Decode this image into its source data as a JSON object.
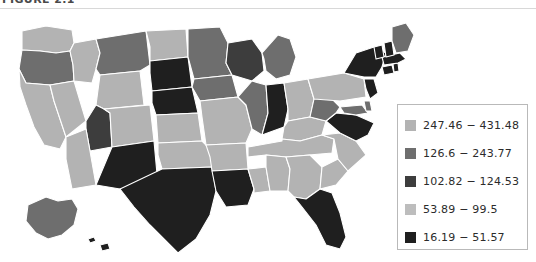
{
  "caption": {
    "text": "FIGURE 2.1"
  },
  "chart_data": {
    "type": "map",
    "title": "",
    "subtitle": "",
    "map_kind": "choropleth",
    "region": "United States",
    "legend": {
      "position": "right",
      "bins": [
        {
          "label": "247.46 − 431.48",
          "color": "#b3b3b3",
          "min": 247.46,
          "max": 431.48
        },
        {
          "label": "126.6 − 243.77",
          "color": "#6e6e6e",
          "min": 126.6,
          "max": 243.77
        },
        {
          "label": "102.82 − 124.53",
          "color": "#3d3d3d",
          "min": 102.82,
          "max": 124.53
        },
        {
          "label": "53.89 − 99.5",
          "color": "#bdbdbd",
          "min": 53.89,
          "max": 99.5
        },
        {
          "label": "16.19 − 51.57",
          "color": "#1f1f1f",
          "min": 16.19,
          "max": 51.57
        }
      ]
    },
    "grid": false,
    "states": [
      {
        "code": "WA",
        "bin": 0,
        "color": "#b3b3b3"
      },
      {
        "code": "OR",
        "bin": 1,
        "color": "#6e6e6e"
      },
      {
        "code": "CA",
        "bin": 0,
        "color": "#b3b3b3"
      },
      {
        "code": "NV",
        "bin": 0,
        "color": "#b3b3b3"
      },
      {
        "code": "ID",
        "bin": 0,
        "color": "#b3b3b3"
      },
      {
        "code": "MT",
        "bin": 1,
        "color": "#6e6e6e"
      },
      {
        "code": "WY",
        "bin": 0,
        "color": "#b3b3b3"
      },
      {
        "code": "UT",
        "bin": 2,
        "color": "#3d3d3d"
      },
      {
        "code": "AZ",
        "bin": 0,
        "color": "#b3b3b3"
      },
      {
        "code": "CO",
        "bin": 0,
        "color": "#b3b3b3"
      },
      {
        "code": "NM",
        "bin": 4,
        "color": "#1f1f1f"
      },
      {
        "code": "ND",
        "bin": 0,
        "color": "#b3b3b3"
      },
      {
        "code": "SD",
        "bin": 4,
        "color": "#1f1f1f"
      },
      {
        "code": "NE",
        "bin": 4,
        "color": "#1f1f1f"
      },
      {
        "code": "KS",
        "bin": 0,
        "color": "#b3b3b3"
      },
      {
        "code": "OK",
        "bin": 0,
        "color": "#b3b3b3"
      },
      {
        "code": "TX",
        "bin": 4,
        "color": "#1f1f1f"
      },
      {
        "code": "MN",
        "bin": 1,
        "color": "#6e6e6e"
      },
      {
        "code": "IA",
        "bin": 1,
        "color": "#6e6e6e"
      },
      {
        "code": "MO",
        "bin": 0,
        "color": "#b3b3b3"
      },
      {
        "code": "AR",
        "bin": 0,
        "color": "#b3b3b3"
      },
      {
        "code": "LA",
        "bin": 4,
        "color": "#1f1f1f"
      },
      {
        "code": "WI",
        "bin": 2,
        "color": "#3d3d3d"
      },
      {
        "code": "IL",
        "bin": 1,
        "color": "#6e6e6e"
      },
      {
        "code": "MS",
        "bin": 0,
        "color": "#b3b3b3"
      },
      {
        "code": "MI",
        "bin": 1,
        "color": "#6e6e6e"
      },
      {
        "code": "IN",
        "bin": 4,
        "color": "#1f1f1f"
      },
      {
        "code": "OH",
        "bin": 0,
        "color": "#b3b3b3"
      },
      {
        "code": "KY",
        "bin": 0,
        "color": "#b3b3b3"
      },
      {
        "code": "TN",
        "bin": 0,
        "color": "#b3b3b3"
      },
      {
        "code": "AL",
        "bin": 0,
        "color": "#b3b3b3"
      },
      {
        "code": "GA",
        "bin": 0,
        "color": "#b3b3b3"
      },
      {
        "code": "FL",
        "bin": 4,
        "color": "#1f1f1f"
      },
      {
        "code": "SC",
        "bin": 0,
        "color": "#b3b3b3"
      },
      {
        "code": "NC",
        "bin": 0,
        "color": "#b3b3b3"
      },
      {
        "code": "VA",
        "bin": 4,
        "color": "#1f1f1f"
      },
      {
        "code": "WV",
        "bin": 1,
        "color": "#6e6e6e"
      },
      {
        "code": "MD",
        "bin": 1,
        "color": "#6e6e6e"
      },
      {
        "code": "DE",
        "bin": 1,
        "color": "#6e6e6e"
      },
      {
        "code": "PA",
        "bin": 0,
        "color": "#b3b3b3"
      },
      {
        "code": "NJ",
        "bin": 4,
        "color": "#1f1f1f"
      },
      {
        "code": "NY",
        "bin": 4,
        "color": "#1f1f1f"
      },
      {
        "code": "CT",
        "bin": 4,
        "color": "#1f1f1f"
      },
      {
        "code": "RI",
        "bin": 4,
        "color": "#1f1f1f"
      },
      {
        "code": "MA",
        "bin": 4,
        "color": "#1f1f1f"
      },
      {
        "code": "VT",
        "bin": 4,
        "color": "#1f1f1f"
      },
      {
        "code": "NH",
        "bin": 4,
        "color": "#1f1f1f"
      },
      {
        "code": "ME",
        "bin": 1,
        "color": "#6e6e6e"
      },
      {
        "code": "AK",
        "bin": 1,
        "color": "#6e6e6e"
      },
      {
        "code": "HI",
        "bin": 4,
        "color": "#1f1f1f"
      }
    ]
  }
}
